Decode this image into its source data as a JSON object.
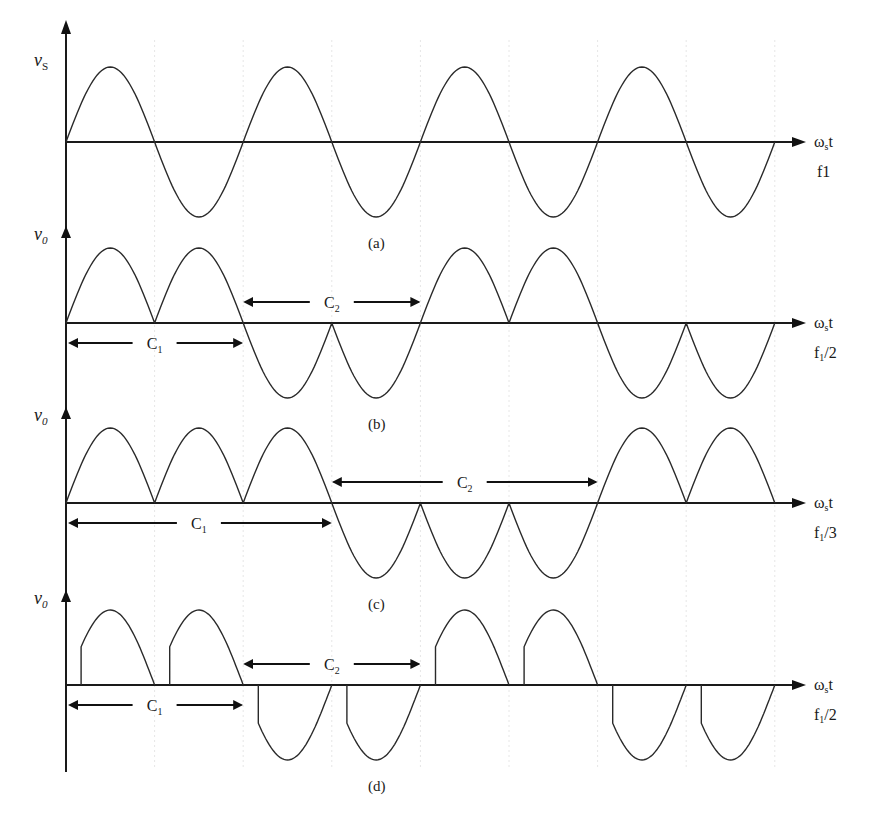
{
  "figure": {
    "panels": [
      {
        "id": "a",
        "caption": "(a)",
        "y_label": "v",
        "y_label_sub": "S",
        "x_label": "ωst",
        "x_label_main": "ω",
        "x_label_sub": "s",
        "x_label_tail": "t",
        "freq_label": "f1",
        "freq_main": "f1",
        "freq_sub": "",
        "freq_tail": "",
        "description": "Input sinusoid, 4 full cycles"
      },
      {
        "id": "b",
        "caption": "(b)",
        "y_label": "v",
        "y_label_sub": "0",
        "x_label_main": "ω",
        "x_label_sub": "s",
        "x_label_tail": "t",
        "freq_main": "f",
        "freq_sub": "1",
        "freq_tail": "/2",
        "c1_label": "C",
        "c1_sub": "1",
        "c2_label": "C",
        "c2_sub": "2",
        "description": "Output at f1/2: 2 positive half-cycles then 2 negative"
      },
      {
        "id": "c",
        "caption": "(c)",
        "y_label": "v",
        "y_label_sub": "0",
        "x_label_main": "ω",
        "x_label_sub": "s",
        "x_label_tail": "t",
        "freq_main": "f",
        "freq_sub": "1",
        "freq_tail": "/3",
        "c1_label": "C",
        "c1_sub": "1",
        "c2_label": "C",
        "c2_sub": "2",
        "description": "Output at f1/3: 3 positive half-cycles then 3 negative"
      },
      {
        "id": "d",
        "caption": "(d)",
        "y_label": "v",
        "y_label_sub": "0",
        "x_label_main": "ω",
        "x_label_sub": "s",
        "x_label_tail": "t",
        "freq_main": "f",
        "freq_sub": "1",
        "freq_tail": "/2",
        "c1_label": "C",
        "c1_sub": "1",
        "c2_label": "C",
        "c2_sub": "2",
        "description": "Output at f1/2 with delayed firing angle (chopped half-cycles)"
      }
    ]
  },
  "chart_data": {
    "type": "line",
    "title": "",
    "xlabel": "ωst",
    "half_cycles": 8,
    "series": [
      {
        "name": "vs (a)",
        "freq": "f1",
        "half_cycle_polarity": [
          1,
          -1,
          1,
          -1,
          1,
          -1,
          1,
          -1
        ]
      },
      {
        "name": "v0 (b)",
        "freq": "f1/2",
        "half_cycle_polarity": [
          1,
          1,
          -1,
          -1,
          1,
          1,
          -1,
          -1
        ],
        "group_C1": "half-cycles 1-2",
        "group_C2": "half-cycles 3-4"
      },
      {
        "name": "v0 (c)",
        "freq": "f1/3",
        "half_cycle_polarity": [
          1,
          1,
          1,
          -1,
          -1,
          -1,
          1,
          1
        ],
        "group_C1": "half-cycles 1-3",
        "group_C2": "half-cycles 4-6"
      },
      {
        "name": "v0 (d)",
        "freq": "f1/2",
        "half_cycle_polarity": [
          1,
          1,
          -1,
          -1,
          1,
          1,
          -1,
          -1
        ],
        "firing_delay": "approx 30° per half-cycle",
        "group_C1": "half-cycles 1-2",
        "group_C2": "half-cycles 3-4"
      }
    ]
  }
}
